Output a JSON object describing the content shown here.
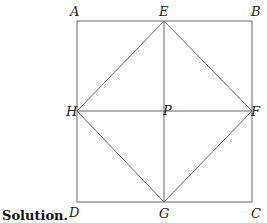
{
  "caption": "Solution.",
  "points": {
    "A": {
      "label": "A",
      "x": 77,
      "y": 21
    },
    "B": {
      "label": "B",
      "x": 252,
      "y": 21
    },
    "C": {
      "label": "C",
      "x": 252,
      "y": 202
    },
    "D": {
      "label": "D",
      "x": 77,
      "y": 202
    },
    "E": {
      "label": "E",
      "x": 164,
      "y": 21
    },
    "F": {
      "label": "F",
      "x": 252,
      "y": 111
    },
    "G": {
      "label": "G",
      "x": 164,
      "y": 202
    },
    "H": {
      "label": "H",
      "x": 77,
      "y": 111
    },
    "P": {
      "label": "P",
      "x": 164,
      "y": 111
    }
  },
  "segments": [
    [
      "A",
      "B"
    ],
    [
      "B",
      "C"
    ],
    [
      "C",
      "D"
    ],
    [
      "D",
      "A"
    ],
    [
      "E",
      "F"
    ],
    [
      "F",
      "G"
    ],
    [
      "G",
      "H"
    ],
    [
      "H",
      "E"
    ],
    [
      "E",
      "G"
    ],
    [
      "H",
      "F"
    ]
  ],
  "colors": {
    "stroke": "#666666",
    "text": "#222222"
  }
}
